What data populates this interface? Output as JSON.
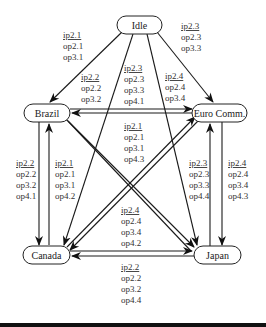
{
  "diagram": {
    "title": "",
    "nodes": {
      "idle": {
        "label": "Idle"
      },
      "brazil": {
        "label": "Brazil"
      },
      "euro": {
        "label": "Euro Comm."
      },
      "canada": {
        "label": "Canada"
      },
      "japan": {
        "label": "Japan"
      }
    },
    "edges": {
      "idle_brazil": {
        "from": "Idle",
        "to": "Brazil",
        "lines": [
          "ip2.1",
          "op2.1",
          "op3.1"
        ]
      },
      "idle_euro": {
        "from": "Idle",
        "to": "Euro Comm.",
        "lines": [
          "ip2.3",
          "op2.3",
          "op3.3"
        ]
      },
      "idle_canada": {
        "from": "Idle",
        "to": "Canada",
        "lines": [
          "ip2.2",
          "op2.2",
          "op3.2"
        ]
      },
      "idle_japan": {
        "from": "Idle",
        "to": "Japan",
        "lines": [
          "ip2.4",
          "op2.4",
          "op3.4"
        ]
      },
      "brazil_euro": {
        "from": "Brazil",
        "to": "Euro Comm.",
        "lines": [
          "ip2.3",
          "op2.3",
          "op3.3",
          "op4.1"
        ]
      },
      "cross_center": {
        "from": "Euro Comm.",
        "to": "Brazil",
        "lines": [
          "ip2.1",
          "op2.1",
          "op3.1",
          "op4.3"
        ]
      },
      "brazil_canada": {
        "from": "Brazil",
        "to": "Canada",
        "lines": [
          "ip2.2",
          "op2.2",
          "op3.2",
          "op4.1"
        ]
      },
      "canada_brazil": {
        "from": "Canada",
        "to": "Brazil",
        "lines": [
          "ip2.1",
          "op2.1",
          "op3.1",
          "op4.2"
        ]
      },
      "japan_euro": {
        "from": "Japan",
        "to": "Euro Comm.",
        "lines": [
          "ip2.3",
          "op2.3",
          "op3.3",
          "op4.4"
        ]
      },
      "euro_japan": {
        "from": "Euro Comm.",
        "to": "Japan",
        "lines": [
          "ip2.4",
          "op2.4",
          "op3.4",
          "op4.3"
        ]
      },
      "canada_japan": {
        "from": "Canada",
        "to": "Japan",
        "lines": [
          "ip2.4",
          "op2.4",
          "op3.4",
          "op4.2"
        ]
      },
      "japan_canada": {
        "from": "Japan",
        "to": "Canada",
        "lines": [
          "ip2.2",
          "op2.2",
          "op3.2",
          "op4.4"
        ]
      }
    },
    "colors": {
      "stroke": "#1a1a1a",
      "text": "#333333",
      "background": "#ffffff"
    }
  }
}
